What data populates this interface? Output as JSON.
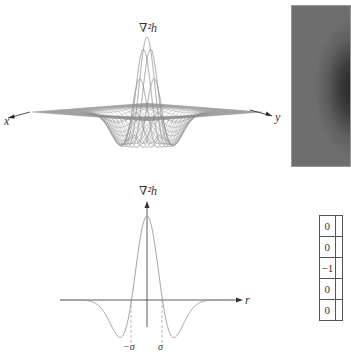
{
  "surface_plot": {
    "z_label": "∇²h",
    "x_axis_label": "x",
    "y_axis_label": "y",
    "description": "3D wireframe of Laplacian of Gaussian (Mexican hat, inverted sign: positive peak)"
  },
  "image_panel": {
    "description": "grayscale image of LoG kernel (dark center blob on gray background)",
    "background_color": "#6e6e6e",
    "center_color": "#262626"
  },
  "profile_plot": {
    "y_axis_label": "∇²h",
    "x_axis_label": "r",
    "tick_labels": [
      "−σ",
      "σ"
    ]
  },
  "mask": {
    "visible_column": [
      "0",
      "0",
      "−1",
      "0",
      "0"
    ]
  },
  "chart_data": {
    "type": "line",
    "title": "",
    "xlabel": "r",
    "ylabel": "∇²h",
    "x_ticks": [
      {
        "label": "−σ",
        "value": -1
      },
      {
        "label": "σ",
        "value": 1
      }
    ],
    "x": [
      -4,
      -3.5,
      -3,
      -2.5,
      -2,
      -1.5,
      -1.41,
      -1,
      -0.5,
      0,
      0.5,
      1,
      1.41,
      1.5,
      2,
      2.5,
      3,
      3.5,
      4
    ],
    "series": [
      {
        "name": "∇²h (cross section)",
        "values": [
          -0.01,
          -0.03,
          -0.08,
          -0.2,
          -0.41,
          -0.56,
          -0.57,
          0.0,
          0.66,
          1.0,
          0.66,
          0.0,
          -0.57,
          -0.56,
          -0.41,
          -0.2,
          -0.08,
          -0.03,
          -0.01
        ]
      }
    ],
    "annotations": [
      "dashed vertical lines at zero crossings r = ±σ"
    ],
    "grid": false,
    "legend": "none"
  }
}
